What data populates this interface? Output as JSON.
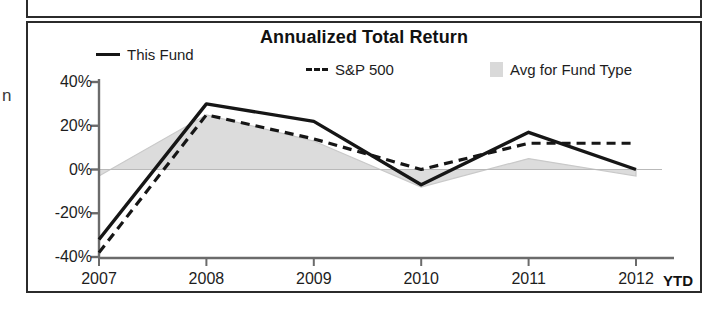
{
  "panel": {
    "title": "Annualized Total Return",
    "edge_glyph": "n"
  },
  "legend": {
    "items": [
      {
        "label": "This Fund",
        "marker": "solid-line-swatch"
      },
      {
        "label": "S&P 500",
        "marker": "dashed-line-swatch"
      },
      {
        "label": "Avg for Fund Type",
        "marker": "area-fill-swatch"
      }
    ]
  },
  "axes": {
    "y_ticks": [
      "40%",
      "20%",
      "0%",
      "-20%",
      "-40%"
    ],
    "x_ticks": [
      "2007",
      "2008",
      "2009",
      "2010",
      "2011",
      "2012"
    ],
    "x_suffix": "YTD"
  },
  "colors": {
    "this_fund_line": "#161616",
    "sp500_line": "#161616",
    "avg_area_fill": "#dcdcdc",
    "avg_area_stroke": "#c9c9c9",
    "axis": "#6b6b6b",
    "panel_border": "#2b2b2b",
    "background": "#ffffff"
  },
  "chart_data": {
    "type": "line",
    "title": "Annualized Total Return",
    "xlabel": "",
    "ylabel": "",
    "categories": [
      "2007",
      "2008",
      "2009",
      "2010",
      "2011",
      "2012"
    ],
    "x_tick_suffix": "YTD",
    "ylim": [
      -40,
      40
    ],
    "y_ticks": [
      40,
      20,
      0,
      -20,
      -40
    ],
    "grid": false,
    "legend_position": "top",
    "series": [
      {
        "name": "This Fund",
        "style": "solid",
        "values": [
          -32,
          30,
          22,
          -7,
          17,
          0
        ]
      },
      {
        "name": "S&P 500",
        "style": "dashed",
        "values": [
          -38,
          25,
          14,
          0,
          12,
          12
        ]
      },
      {
        "name": "Avg for Fund Type",
        "style": "area",
        "values": [
          -3,
          25,
          13,
          -8,
          5,
          -3
        ]
      }
    ]
  }
}
